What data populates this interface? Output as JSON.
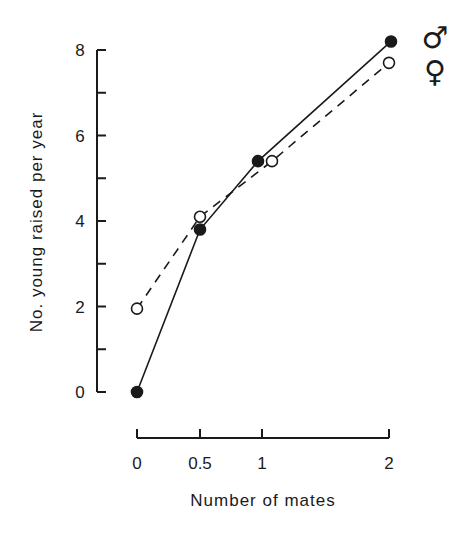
{
  "chart_data": {
    "type": "line",
    "title": "",
    "xlabel": "Number of mates",
    "ylabel": "No. young raised per year",
    "x_ticks": [
      "0",
      "0.5",
      "1",
      "2"
    ],
    "y_ticks": [
      "0",
      "2",
      "4",
      "6",
      "8"
    ],
    "xlim": [
      0,
      2
    ],
    "ylim": [
      0,
      8
    ],
    "grid": false,
    "legend": {
      "position": "right",
      "entries": [
        "♂",
        "♀"
      ]
    },
    "series": [
      {
        "name": "♂",
        "label": "male",
        "marker": "filled-circle",
        "line": "solid",
        "x": [
          0,
          0.5,
          1,
          2
        ],
        "values": [
          0.0,
          3.8,
          5.4,
          8.2
        ]
      },
      {
        "name": "♀",
        "label": "female",
        "marker": "open-circle",
        "line": "dashed",
        "x": [
          0,
          0.5,
          1,
          2
        ],
        "values": [
          1.95,
          4.1,
          5.4,
          7.7
        ]
      }
    ]
  }
}
